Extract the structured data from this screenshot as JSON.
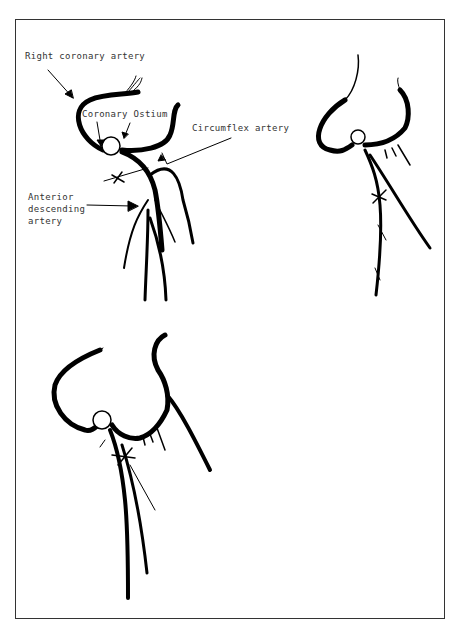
{
  "figure": {
    "panels": [
      {
        "id": "top-left",
        "description": "labeled coronary artery anatomy with lesion marked"
      },
      {
        "id": "top-right",
        "description": "variant with lesion on anterior descending artery"
      },
      {
        "id": "bottom-left",
        "description": "variant with lesion near ostium branch"
      }
    ],
    "labels": {
      "right_coronary": "Right coronary artery",
      "ostium": "Coronary Ostium",
      "circumflex": "Circumflex artery",
      "anterior_1": "Anterior",
      "anterior_2": "descending",
      "anterior_3": "artery"
    },
    "colors": {
      "ink": "#000000",
      "frame": "#333333",
      "background": "#ffffff"
    }
  }
}
